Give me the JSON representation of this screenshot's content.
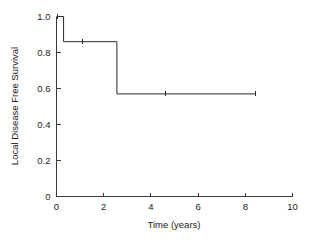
{
  "figure": {
    "background_color": "#ffffff",
    "line_color": "#2b2b2b",
    "axis_color": "#3a3a3a",
    "text_color": "#1a1a1a"
  },
  "chart_data": {
    "type": "line",
    "subtype": "kaplan-meier-step",
    "title": "",
    "subtitle": "",
    "xlabel": "Time (years)",
    "ylabel": "Local Disease Free Survival",
    "xlim": [
      0,
      10
    ],
    "ylim": [
      0,
      1.0
    ],
    "xticks": [
      0,
      2,
      4,
      6,
      8,
      10
    ],
    "xticklabels": [
      "0",
      "2",
      "4",
      "6",
      "8",
      "10"
    ],
    "yticks": [
      0,
      0.2,
      0.4,
      0.6,
      0.8,
      1.0
    ],
    "yticklabels": [
      "0",
      "0.2",
      "0.4",
      "0.6",
      "0.8",
      "1.0"
    ],
    "grid": false,
    "legend": false,
    "legend_position": "none",
    "series": [
      {
        "name": "Local Disease Free Survival",
        "step_mode": "post",
        "x": [
          0.0,
          0.3,
          0.3,
          2.56,
          2.56,
          8.45
        ],
        "y": [
          1.0,
          1.0,
          0.86,
          0.86,
          0.57,
          0.57
        ],
        "events": [
          {
            "time": 0.3,
            "survival_before": 1.0,
            "survival_after": 0.86
          },
          {
            "time": 2.56,
            "survival_before": 0.86,
            "survival_after": 0.57
          }
        ],
        "censored": [
          {
            "time": 0.05,
            "survival": 1.0
          },
          {
            "time": 1.1,
            "survival": 0.86
          },
          {
            "time": 4.6,
            "survival": 0.57
          },
          {
            "time": 8.45,
            "survival": 0.57
          }
        ]
      }
    ]
  }
}
